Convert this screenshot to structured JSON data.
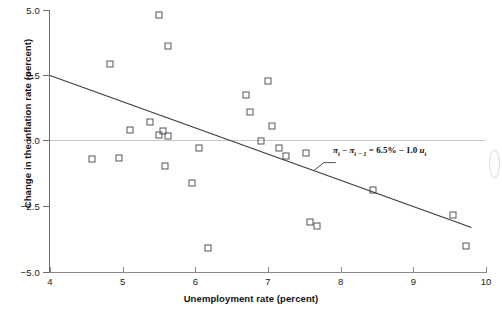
{
  "chart_data": {
    "type": "scatter",
    "title": "",
    "xlabel": "Unemployment rate (percent)",
    "ylabel": "Change in the inflation rate (percent)",
    "xlim": [
      4,
      10
    ],
    "ylim": [
      -5.0,
      5.0
    ],
    "xticks": [
      "4",
      "5",
      "6",
      "7",
      "8",
      "9",
      "10"
    ],
    "xtick_values": [
      4,
      5,
      6,
      7,
      8,
      9,
      10
    ],
    "yticks": [
      "5.0",
      "2.5",
      "0.0",
      "−2.5",
      "−5.0"
    ],
    "ytick_values": [
      5.0,
      2.5,
      0.0,
      -2.5,
      -5.0
    ],
    "grid": false,
    "zero_line": true,
    "legend": "none",
    "marker": "open-square",
    "points": [
      {
        "x": 4.58,
        "y": -0.7
      },
      {
        "x": 4.83,
        "y": 2.93
      },
      {
        "x": 4.95,
        "y": -0.63
      },
      {
        "x": 5.1,
        "y": 0.42
      },
      {
        "x": 5.5,
        "y": 4.82
      },
      {
        "x": 5.38,
        "y": 0.72
      },
      {
        "x": 5.5,
        "y": 0.22
      },
      {
        "x": 5.55,
        "y": 0.38
      },
      {
        "x": 5.62,
        "y": 0.18
      },
      {
        "x": 5.62,
        "y": 3.62
      },
      {
        "x": 5.58,
        "y": -0.95
      },
      {
        "x": 5.95,
        "y": -1.6
      },
      {
        "x": 6.05,
        "y": -0.25
      },
      {
        "x": 6.18,
        "y": -4.1
      },
      {
        "x": 6.7,
        "y": 1.75
      },
      {
        "x": 6.75,
        "y": 1.12
      },
      {
        "x": 6.9,
        "y": 0.0
      },
      {
        "x": 7.0,
        "y": 2.3
      },
      {
        "x": 7.05,
        "y": 0.58
      },
      {
        "x": 7.15,
        "y": -0.28
      },
      {
        "x": 7.25,
        "y": -0.58
      },
      {
        "x": 7.52,
        "y": -0.45
      },
      {
        "x": 7.58,
        "y": -3.1
      },
      {
        "x": 7.68,
        "y": -3.25
      },
      {
        "x": 8.45,
        "y": -1.88
      },
      {
        "x": 9.55,
        "y": -2.82
      },
      {
        "x": 9.72,
        "y": -4.02
      }
    ],
    "regression_line": {
      "label": "πt − πt−1 = 6.5% − 1.0 ut",
      "intercept": 6.5,
      "slope": -1.0,
      "x_start": 4.0,
      "y_start": 2.5,
      "x_end": 9.8,
      "y_end": -3.3
    },
    "equation": {
      "pi_t": "π",
      "sub_t": "t",
      "sub_t1": "t − 1",
      "constant": "6.5%",
      "coefficient": "1.0",
      "u_t": "u",
      "full_text": "πt − πt−1 = 6.5% − 1.0 ut"
    },
    "colors": {
      "marker_stroke": "#55555c",
      "axis": "#6e6e6e",
      "zero_line": "#c8c8c8",
      "regression_line": "#3a3a3a",
      "text": "#111111"
    }
  }
}
